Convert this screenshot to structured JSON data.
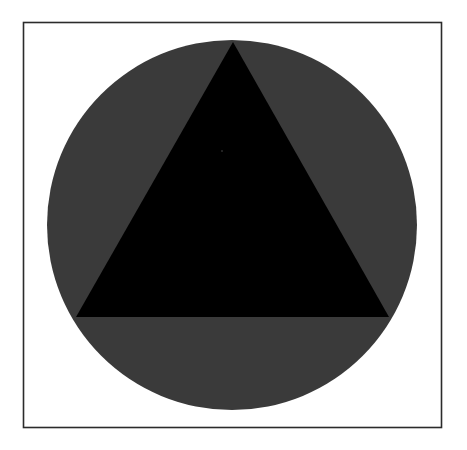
{
  "canvas": {
    "width": 467,
    "height": 450,
    "background_color": "#ffffff",
    "description": "Flat geometric figure: a black equilateral-style triangle inscribed over a dark gray circle, enclosed in a thin rectangular frame."
  },
  "frame": {
    "name": "rectangular-border",
    "x": 23.5,
    "y": 22.5,
    "width": 418,
    "height": 405,
    "stroke_color": "#2b2b2b",
    "stroke_width": 1.6,
    "fill_color": "#ffffff"
  },
  "shapes": {
    "circle": {
      "label": "dark gray circle",
      "cx": 232,
      "cy": 225,
      "r": 185,
      "fill_color": "#3a3a3a"
    },
    "triangle": {
      "label": "black triangle",
      "fill_color": "#000000",
      "points": "233,42 389,317 76,317",
      "vertices": [
        {
          "name": "apex",
          "x": 233,
          "y": 42
        },
        {
          "name": "bottom-right",
          "x": 389,
          "y": 317
        },
        {
          "name": "bottom-left",
          "x": 76,
          "y": 317
        }
      ]
    },
    "speck": {
      "label": "faint speck",
      "cx": 222,
      "cy": 151,
      "r": 1.1,
      "fill_color": "#2a2a2a"
    }
  }
}
